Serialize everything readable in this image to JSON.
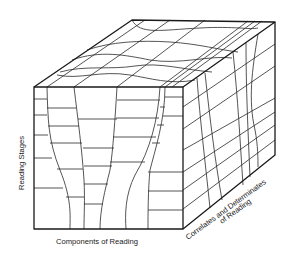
{
  "diagram": {
    "type": "3d-cube-grid",
    "axes": {
      "vertical": "Reading Stages",
      "horizontal": "Components of Reading",
      "depth_line1": "Correlates and Determinates",
      "depth_line2": "of Reading"
    },
    "colors": {
      "line": "#1a1a1a",
      "background": "#ffffff"
    }
  }
}
